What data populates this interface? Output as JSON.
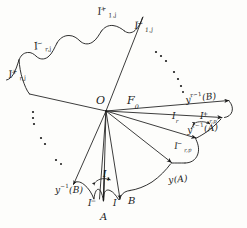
{
  "figure": {
    "kind": "hand-drawn-mathematical-diagram",
    "title": "",
    "background_color": "#fdfdfb",
    "ink_color": "#1a1a1a",
    "width": 247,
    "height": 228
  },
  "labels": {
    "origin": "O",
    "fan_region": "F",
    "fan_region_sub": "0",
    "top_mid": {
      "base": "I",
      "sup": "+",
      "sub": "1,j"
    },
    "top_right": {
      "base": "I",
      "sup": "−",
      "sub": "1,j"
    },
    "upper_left": {
      "base": "I",
      "sup": "−",
      "sub": "r,j"
    },
    "far_left": {
      "base": "I",
      "sup": "+",
      "sub": "r,j"
    },
    "right_yB": {
      "base": "y",
      "sup": "r−1",
      "arg": "(B)"
    },
    "right_yA": {
      "base": "y",
      "sup": "r−1",
      "arg": "(A)"
    },
    "right_Ir": {
      "base": "I",
      "sub": "r"
    },
    "right_Irp_plus": {
      "base": "I",
      "sup": "+",
      "sub": "r,p"
    },
    "right_Irp_minus": {
      "base": "I",
      "sup": "−",
      "sub": "r,p"
    },
    "bottom_yA": {
      "base": "y",
      "arg": "(A)"
    },
    "bottom_yB": {
      "base": "y",
      "sup": "−1",
      "arg": "(B)"
    },
    "bottom_I1": {
      "base": "I",
      "sub": "1"
    },
    "bottom_Iminus": {
      "base": "I",
      "sup": "−"
    },
    "bottom_I": {
      "base": "I"
    },
    "bottom_B": "B",
    "bottom_A": "A"
  },
  "ellipses": {
    "right_dots_count": 7,
    "left_dots_count": 7,
    "note": "dotted arcs indicating continuation of the scalloped boundary"
  },
  "geometry": {
    "origin_point": [
      106,
      111
    ],
    "fan_rays": [
      [
        106,
        111,
        143,
        17
      ],
      [
        106,
        111,
        29,
        94
      ],
      [
        106,
        111,
        231,
        100
      ],
      [
        106,
        111,
        224,
        117
      ],
      [
        106,
        111,
        197,
        139
      ],
      [
        106,
        111,
        172,
        163
      ],
      [
        106,
        111,
        120,
        200
      ],
      [
        106,
        111,
        103,
        201
      ],
      [
        106,
        111,
        73,
        185
      ]
    ]
  }
}
